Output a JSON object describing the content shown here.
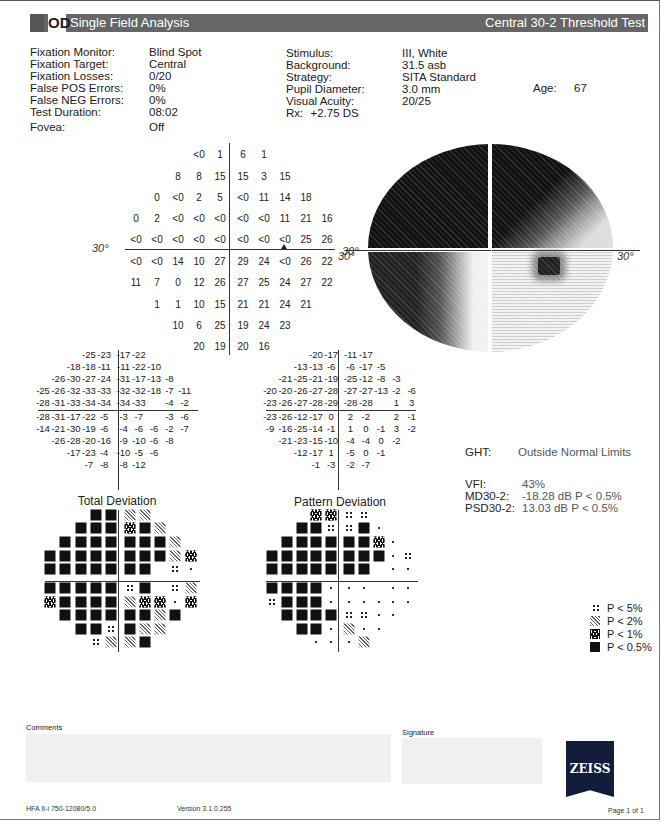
{
  "header": {
    "eye": "OD",
    "title": "Single Field Analysis",
    "test": "Central 30-2 Threshold Test"
  },
  "reliability": [
    {
      "label": "Fixation Monitor:",
      "value": "Blind Spot"
    },
    {
      "label": "Fixation Target:",
      "value": "Central"
    },
    {
      "label": "Fixation Losses:",
      "value": "0/20"
    },
    {
      "label": "False POS Errors:",
      "value": "0%"
    },
    {
      "label": "False NEG Errors:",
      "value": "0%"
    },
    {
      "label": "Test Duration:",
      "value": "08:02"
    },
    {
      "label": "Fovea:",
      "value": "Off"
    }
  ],
  "parameters": [
    {
      "label": "Stimulus:",
      "value": "III, White"
    },
    {
      "label": "Background:",
      "value": "31.5 asb"
    },
    {
      "label": "Strategy:",
      "value": "SITA Standard"
    },
    {
      "label": "Pupil Diameter:",
      "value": "3.0 mm"
    },
    {
      "label": "Visual Acuity:",
      "value": "20/25"
    },
    {
      "label": "Rx:",
      "value": "+2.75 DS"
    }
  ],
  "patient": {
    "age_label": "Age:",
    "age": "67"
  },
  "axis_labels": {
    "left": "30°",
    "right": "30°"
  },
  "threshold": {
    "rows": [
      [
        "<0",
        "1",
        "6",
        "1"
      ],
      [
        "8",
        "8",
        "15",
        "15",
        "3",
        "15"
      ],
      [
        "0",
        "<0",
        "2",
        "5",
        "<0",
        "11",
        "14",
        "18"
      ],
      [
        "0",
        "2",
        "<0",
        "<0",
        "<0",
        "<0",
        "<0",
        "11",
        "21",
        "16"
      ],
      [
        "<0",
        "<0",
        "<0",
        "<0",
        "<0",
        "<0",
        "<0",
        "<0",
        "25",
        "26"
      ],
      [
        "<0",
        "<0",
        "14",
        "10",
        "27",
        "29",
        "24",
        "<0",
        "26",
        "22"
      ],
      [
        "11",
        "7",
        "0",
        "12",
        "26",
        "27",
        "25",
        "24",
        "27",
        "22"
      ],
      [
        "1",
        "1",
        "10",
        "15",
        "21",
        "21",
        "24",
        "21"
      ],
      [
        "10",
        "6",
        "25",
        "19",
        "24",
        "23"
      ],
      [
        "20",
        "19",
        "20",
        "16"
      ]
    ]
  },
  "total_deviation": {
    "title": "Total Deviation",
    "values": [
      [
        "-25",
        "-23",
        "-17",
        "-22"
      ],
      [
        "-18",
        "-18",
        "-11",
        "-11",
        "-22",
        "-10"
      ],
      [
        "-26",
        "-30",
        "-27",
        "-24",
        "-31",
        "-17",
        "-13",
        "-8"
      ],
      [
        "-25",
        "-26",
        "-32",
        "-33",
        "-33",
        "-32",
        "-32",
        "-18",
        "-7",
        "-11"
      ],
      [
        "-28",
        "-31",
        "-33",
        "-34",
        "-34",
        "-34",
        "-33",
        "",
        "-4",
        "-2"
      ],
      [
        "-28",
        "-31",
        "-17",
        "-22",
        "-5",
        "-3",
        "-7",
        "",
        "-3",
        "-6"
      ],
      [
        "-14",
        "-21",
        "-30",
        "-19",
        "-6",
        "-4",
        "-6",
        "-6",
        "-2",
        "-7"
      ],
      [
        "-26",
        "-28",
        "-20",
        "-16",
        "-9",
        "-10",
        "-6",
        "-8"
      ],
      [
        "-17",
        "-23",
        "-4",
        "-10",
        "-5",
        "-6"
      ],
      [
        "-7",
        "-8",
        "-8",
        "-12"
      ]
    ],
    "probability": [
      [
        "p05",
        "p05",
        "p2",
        "p2"
      ],
      [
        "p05",
        "p05",
        "p05",
        "p1",
        "p05",
        "p2"
      ],
      [
        "p05",
        "p05",
        "p05",
        "p05",
        "p05",
        "p05",
        "p05",
        "p2"
      ],
      [
        "p05",
        "p05",
        "p05",
        "p05",
        "p05",
        "p05",
        "p05",
        "p05",
        "p2",
        "p1"
      ],
      [
        "p05",
        "p05",
        "p05",
        "p05",
        "p05",
        "p05",
        "p05",
        "blank",
        "p5",
        "dot"
      ],
      [
        "p05",
        "p05",
        "p05",
        "p05",
        "p05",
        "p5",
        "p05",
        "blank",
        "p5",
        "p2"
      ],
      [
        "p1",
        "p05",
        "p05",
        "p05",
        "p05",
        "p2",
        "p1",
        "p1",
        "dot",
        "p1"
      ],
      [
        "p05",
        "p05",
        "p05",
        "p05",
        "p05",
        "p05",
        "p2",
        "p05"
      ],
      [
        "p05",
        "p05",
        "p5",
        "p05",
        "p2",
        "p2"
      ],
      [
        "p5",
        "p2",
        "p2",
        "p05"
      ]
    ]
  },
  "pattern_deviation": {
    "title": "Pattern Deviation",
    "values": [
      [
        "-20",
        "-17",
        "-11",
        "-17"
      ],
      [
        "-13",
        "-13",
        "-6",
        "-6",
        "-17",
        "-5"
      ],
      [
        "-21",
        "-25",
        "-21",
        "-19",
        "-25",
        "-12",
        "-8",
        "-3"
      ],
      [
        "-20",
        "-20",
        "-26",
        "-27",
        "-28",
        "-27",
        "-27",
        "-13",
        "-2",
        "-6"
      ],
      [
        "-23",
        "-26",
        "-27",
        "-28",
        "-29",
        "-28",
        "-28",
        "",
        "1",
        "3"
      ],
      [
        "-23",
        "-26",
        "-12",
        "-17",
        "0",
        "2",
        "-2",
        "",
        "2",
        "-1"
      ],
      [
        "-9",
        "-16",
        "-25",
        "-14",
        "-1",
        "1",
        "0",
        "-1",
        "3",
        "-2"
      ],
      [
        "-21",
        "-23",
        "-15",
        "-10",
        "-4",
        "-4",
        "0",
        "-2"
      ],
      [
        "-12",
        "-17",
        "1",
        "-5",
        "0",
        "-1"
      ],
      [
        "-1",
        "-3",
        "-2",
        "-7"
      ]
    ],
    "probability": [
      [
        "p1",
        "p1",
        "p5",
        "p5"
      ],
      [
        "p05",
        "p05",
        "p5",
        "p5",
        "p05",
        "dot"
      ],
      [
        "p05",
        "p05",
        "p05",
        "p05",
        "p05",
        "p05",
        "p1",
        "dot"
      ],
      [
        "p05",
        "p05",
        "p05",
        "p05",
        "p05",
        "p05",
        "p05",
        "p05",
        "dot",
        "p5"
      ],
      [
        "p05",
        "p05",
        "p05",
        "p05",
        "p05",
        "p05",
        "p05",
        "blank",
        "dot",
        "dot"
      ],
      [
        "p05",
        "p05",
        "p05",
        "p05",
        "dot",
        "dot",
        "dot",
        "blank",
        "dot",
        "dot"
      ],
      [
        "p5",
        "p05",
        "p05",
        "p05",
        "dot",
        "dot",
        "dot",
        "dot",
        "dot",
        "dot"
      ],
      [
        "p05",
        "p05",
        "p05",
        "p05",
        "p5",
        "p5",
        "dot",
        "dot"
      ],
      [
        "p05",
        "p05",
        "dot",
        "p2",
        "dot",
        "dot"
      ],
      [
        "dot",
        "dot",
        "dot",
        "p2"
      ]
    ]
  },
  "global_indices": {
    "ght_label": "GHT:",
    "ght_value": "Outside Normal Limits",
    "vfi_label": "VFI:",
    "vfi_value": "43%",
    "md_label": "MD30-2:",
    "md_value": "-18.28 dB P < 0.5%",
    "psd_label": "PSD30-2:",
    "psd_value": "13.03 dB P < 0.5%"
  },
  "legend": [
    {
      "symbol": "p5",
      "label": "P < 5%"
    },
    {
      "symbol": "p2",
      "label": "P < 2%"
    },
    {
      "symbol": "p1",
      "label": "P < 1%"
    },
    {
      "symbol": "p05",
      "label": "P < 0.5%"
    }
  ],
  "footer": {
    "comments_label": "Comments",
    "signature_label": "Signature",
    "brand": "ZEISS",
    "device": "HFA II-i 750-12080/5.0",
    "version": "Version 3.1.0.255",
    "page": "Page 1 of 1"
  }
}
